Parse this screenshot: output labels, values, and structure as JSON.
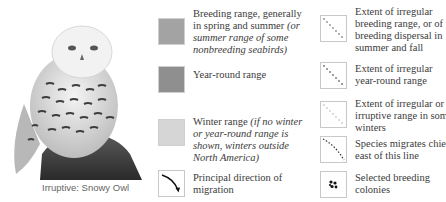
{
  "illustration": {
    "subject": "snowy-owl-illustration",
    "caption": "Irruptive: Snowy Owl"
  },
  "legend": {
    "left_column": [
      {
        "id": "breeding",
        "swatch_color": "#a3a3a3",
        "text": "Breeding range, generally in spring and summer",
        "italic_note": "(or summer range of some nonbreeding seabirds)"
      },
      {
        "id": "year-round",
        "swatch_color": "#8f8f8f",
        "text": "Year-round range",
        "italic_note": ""
      },
      {
        "id": "winter",
        "swatch_color": "#d6d6d6",
        "text": "Winter range",
        "italic_note": "(if no winter or year-round range is shown, winters outside North America)"
      },
      {
        "id": "migration-direction",
        "icon": "curved-arrow-icon",
        "text": "Principal direction of migration",
        "italic_note": ""
      }
    ],
    "right_column": [
      {
        "id": "irregular-breeding",
        "icon": "dotted-diagonal-line-icon",
        "dot_color": "#9a9a9a",
        "text": "Extent of irregular breeding range, or of post-breeding dispersal in summer and fall"
      },
      {
        "id": "irregular-year-round",
        "icon": "dotted-diagonal-line-icon",
        "dot_color": "#8a8a8a",
        "text": "Extent of irregular year-round range"
      },
      {
        "id": "irruptive-winter",
        "icon": "faint-dotted-diagonal-line-icon",
        "dot_color": "#d0d0d0",
        "text": "Extent of irregular or irruptive range in some winters"
      },
      {
        "id": "migrates-east",
        "icon": "dashed-diagonal-line-icon",
        "dot_color": "#333333",
        "text": "Species migrates chiefly east of this line"
      },
      {
        "id": "breeding-colonies",
        "icon": "dot-cluster-icon",
        "dot_color": "#111111",
        "text": "Selected breeding colonies"
      }
    ]
  }
}
